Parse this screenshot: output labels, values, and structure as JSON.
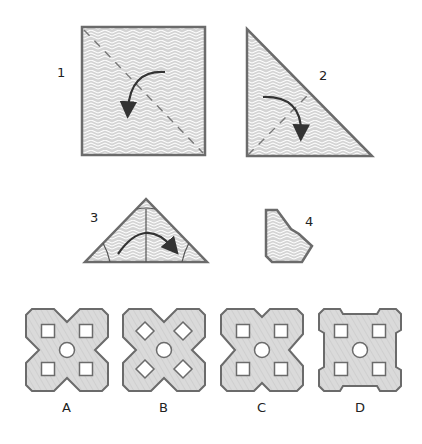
{
  "puzzle": {
    "type": "paper-folding",
    "steps": [
      {
        "label": "1",
        "shape": "square",
        "fold": "diagonal",
        "arrow": "curved-arrow-down-left"
      },
      {
        "label": "2",
        "shape": "right-triangle",
        "fold": "dashed-diagonal",
        "arrow": "curved-arrow-down-right"
      },
      {
        "label": "3",
        "shape": "isosceles-triangle",
        "fold": "corner-creases",
        "arrow": "curved-arrow-right"
      },
      {
        "label": "4",
        "shape": "cut-polygon"
      }
    ],
    "options": [
      {
        "label": "A",
        "outline": "notched-x",
        "holes": "squares-with-center-circle"
      },
      {
        "label": "B",
        "outline": "notched-x",
        "holes": "diamonds-with-center-circle"
      },
      {
        "label": "C",
        "outline": "notched-x-deep",
        "holes": "squares-with-center-circle"
      },
      {
        "label": "D",
        "outline": "notched-square",
        "holes": "squares-with-center-circle"
      }
    ]
  },
  "colors": {
    "outline": "#6b6b6b",
    "fill": "#d9d9d9",
    "pattern_line": "#ffffff",
    "text": "#222222"
  }
}
